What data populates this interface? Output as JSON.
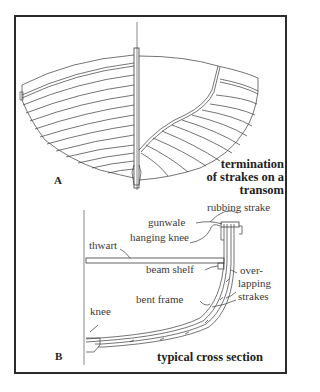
{
  "figure": {
    "panel_a": {
      "letter": "A",
      "caption_lines": [
        "termination",
        "of strakes on a",
        "transom"
      ]
    },
    "panel_b": {
      "letter": "B",
      "caption": "typical cross section",
      "labels": {
        "rubbing_strake": "rubbing strake",
        "gunwale": "gunwale",
        "hanging_knee": "hanging knee",
        "thwart": "thwart",
        "beam_shelf": "beam shelf",
        "over": "over-",
        "lapping": "lapping",
        "strakes": "strakes",
        "bent_frame": "bent frame",
        "knee": "knee"
      }
    },
    "colors": {
      "line": "#3a3a3a",
      "border": "#2b2b2b",
      "background": "#ffffff"
    }
  }
}
